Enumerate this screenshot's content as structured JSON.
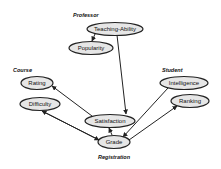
{
  "diagram": {
    "groups": [
      {
        "id": "professor",
        "label": "Professor",
        "x": 73,
        "y": 17
      },
      {
        "id": "course",
        "label": "Course",
        "x": 13,
        "y": 72
      },
      {
        "id": "student",
        "label": "Student",
        "x": 162,
        "y": 72
      },
      {
        "id": "registration",
        "label": "Registration",
        "x": 98,
        "y": 159
      }
    ],
    "nodes": [
      {
        "id": "teaching_ability",
        "label": "Teaching-Ability",
        "cx": 115,
        "cy": 29,
        "rx": 28,
        "ry": 6.5
      },
      {
        "id": "popularity",
        "label": "Popularity",
        "cx": 91,
        "cy": 48,
        "rx": 22,
        "ry": 6.5
      },
      {
        "id": "rating",
        "label": "Rating",
        "cx": 37,
        "cy": 83,
        "rx": 16,
        "ry": 6.5
      },
      {
        "id": "difficulty",
        "label": "Difficulty",
        "cx": 40,
        "cy": 104,
        "rx": 20,
        "ry": 6.5
      },
      {
        "id": "intelligence",
        "label": "Intelligence",
        "cx": 184,
        "cy": 83,
        "rx": 24,
        "ry": 6.5
      },
      {
        "id": "ranking",
        "label": "Ranking",
        "cx": 190,
        "cy": 101,
        "rx": 19,
        "ry": 6.5
      },
      {
        "id": "satisfaction",
        "label": "Satisfaction",
        "cx": 110,
        "cy": 121,
        "rx": 25,
        "ry": 6.5
      },
      {
        "id": "grade",
        "label": "Grade",
        "cx": 114,
        "cy": 142,
        "rx": 16,
        "ry": 6.5
      }
    ],
    "edges": [
      {
        "from": "teaching_ability",
        "to": "popularity",
        "x1": 95,
        "y1": 34,
        "x2": 92,
        "y2": 41
      },
      {
        "from": "teaching_ability",
        "to": "satisfaction",
        "x1": 117,
        "y1": 35,
        "x2": 126,
        "y2": 114
      },
      {
        "from": "satisfaction",
        "to": "rating",
        "x1": 92,
        "y1": 116,
        "x2": 52,
        "y2": 86
      },
      {
        "from": "grade",
        "to": "difficulty",
        "x1": 99,
        "y1": 140,
        "x2": 42,
        "y2": 111
      },
      {
        "from": "difficulty",
        "to": "grade",
        "x1": 42,
        "y1": 111,
        "x2": 99,
        "y2": 140
      },
      {
        "from": "grade",
        "to": "satisfaction",
        "x1": 112,
        "y1": 135,
        "x2": 109,
        "y2": 128
      },
      {
        "from": "intelligence",
        "to": "grade",
        "x1": 168,
        "y1": 88,
        "x2": 123,
        "y2": 137
      },
      {
        "from": "grade",
        "to": "ranking",
        "x1": 129,
        "y1": 140,
        "x2": 177,
        "y2": 106
      }
    ]
  }
}
